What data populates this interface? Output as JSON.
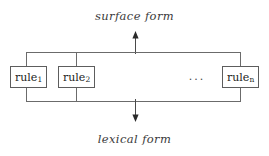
{
  "diagram": {
    "title_top": "surface form",
    "title_bottom": "lexical form",
    "ellipsis": "...",
    "stroke_color": "#6b6b6b",
    "box_border_color": "#5d5d5d",
    "text_color": "#1c1c1c",
    "label_color": "#3a3a3a",
    "background": "#ffffff",
    "rules": [
      {
        "base": "rule",
        "subscript": "1",
        "full": "rule1"
      },
      {
        "base": "rule",
        "subscript": "2",
        "full": "rule2"
      },
      {
        "base": "rule",
        "subscript": "n",
        "full": "rulen"
      }
    ],
    "arrows": [
      {
        "name": "up-to-surface-form",
        "direction": "up"
      },
      {
        "name": "down-to-lexical-form",
        "direction": "down"
      }
    ]
  }
}
